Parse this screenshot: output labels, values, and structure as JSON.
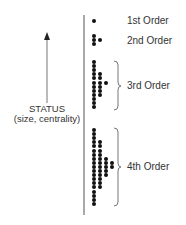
{
  "axis": {
    "label_line1": "STATUS",
    "label_line2": "(size, centrality)"
  },
  "orders": [
    {
      "label": "1st Order",
      "columns": [
        1
      ]
    },
    {
      "label": "2nd Order",
      "columns": [
        3,
        1
      ]
    },
    {
      "label": "3rd Order",
      "columns": [
        12,
        6,
        1
      ]
    },
    {
      "label": "4th Order",
      "columns": [
        19,
        12,
        5,
        2
      ]
    }
  ],
  "colors": {
    "dot": "#111111",
    "line": "#555555",
    "text": "#333333"
  }
}
